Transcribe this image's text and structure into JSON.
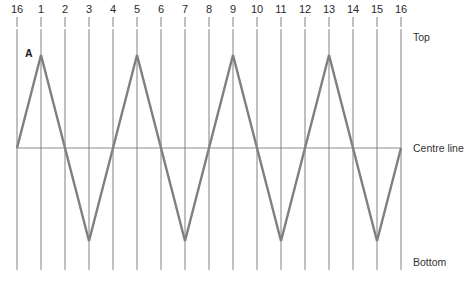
{
  "chart_data": {
    "type": "line",
    "title": "",
    "xlabel": "",
    "ylabel": "",
    "grid": true,
    "legend": "none",
    "x_tick_labels": [
      "16",
      "1",
      "2",
      "3",
      "4",
      "5",
      "6",
      "7",
      "8",
      "9",
      "10",
      "11",
      "12",
      "13",
      "14",
      "15",
      "16"
    ],
    "y_level_labels": [
      "Top",
      "Centre line",
      "Bottom"
    ],
    "ylim": [
      -1,
      1
    ],
    "y_levels": {
      "top": 1,
      "centre": 0,
      "bottom": -1
    },
    "amplitude": 1,
    "cycles": 4,
    "series": [
      {
        "name": "A",
        "annotation": "A",
        "color": "#7f7f7f",
        "x": [
          0,
          1,
          2,
          3,
          4,
          5,
          6,
          7,
          8,
          9,
          10,
          11,
          12,
          13,
          14,
          15,
          16
        ],
        "values": [
          0,
          1,
          0,
          -1,
          0,
          1,
          0,
          -1,
          0,
          1,
          0,
          -1,
          0,
          1,
          0,
          -1,
          0
        ]
      }
    ]
  },
  "axis": {
    "top_ticks": [
      "16",
      "1",
      "2",
      "3",
      "4",
      "5",
      "6",
      "7",
      "8",
      "9",
      "10",
      "11",
      "12",
      "13",
      "14",
      "15",
      "16"
    ]
  },
  "levels": {
    "top_label": "Top",
    "centre_label": "Centre line",
    "bottom_label": "Bottom"
  },
  "annotations": {
    "wave_a": "A"
  },
  "colors": {
    "waveform": "#7f7f7f",
    "gridline": "#8c8c8c",
    "centre_line": "#8c8c8c",
    "tick": "#8c8c8c",
    "text": "#2b2b2b",
    "background": "#ffffff"
  }
}
